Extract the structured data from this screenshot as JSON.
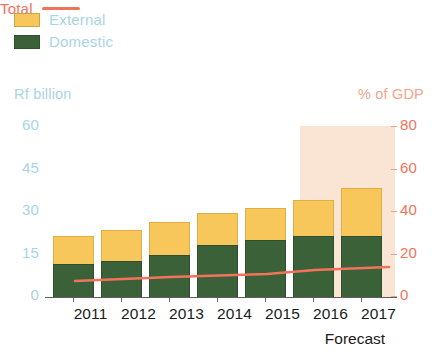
{
  "legend": {
    "external_label": "External",
    "domestic_label": "Domestic",
    "total_label": "Total"
  },
  "axes": {
    "left_title": "Rf billion",
    "right_title": "% of GDP",
    "left_ticks": [
      "0",
      "15",
      "30",
      "45",
      "60"
    ],
    "right_ticks": [
      "0",
      "20",
      "40",
      "60",
      "80"
    ]
  },
  "forecast_caption": "Forecast",
  "colors": {
    "external": "#f7c75c",
    "domestic": "#3b6138",
    "total_line": "#f2725c",
    "forecast_shade": "#f8d9c4",
    "left_axis_text": "#a8d4e8",
    "right_axis_text": "#f2725c",
    "x_axis_text": "#1b1b1b"
  },
  "chart_data": {
    "type": "bar",
    "title": "",
    "subtitle": "",
    "xlabel": "",
    "ylabel": "Rf billion",
    "y2label": "% of GDP",
    "ylim": [
      0,
      60
    ],
    "y2lim": [
      0,
      80
    ],
    "grid": false,
    "legend_position": "top",
    "categories": [
      "2011",
      "2012",
      "2013",
      "2014",
      "2015",
      "2016",
      "2017"
    ],
    "series": [
      {
        "name": "Domestic",
        "stack": "total",
        "color": "#3b6138",
        "values": [
          12.0,
          13.2,
          15.0,
          18.8,
          20.5,
          21.8,
          21.8
        ]
      },
      {
        "name": "External",
        "stack": "total",
        "color": "#f7c75c",
        "values": [
          9.5,
          10.2,
          10.0,
          10.2,
          10.5,
          12.4,
          16.4
        ]
      }
    ],
    "totals": [
      21.5,
      23.4,
      25.0,
      29.0,
      31.0,
      34.2,
      38.2
    ],
    "line_series": {
      "name": "Total",
      "axis": "right",
      "color": "#f2725c",
      "unit": "% of GDP",
      "x": [
        "2011",
        "2012",
        "2013",
        "2014",
        "2015",
        "2016",
        "2017"
      ],
      "values": [
        63.5,
        64.3,
        65.0,
        65.6,
        66.3,
        68.0,
        70.0
      ]
    },
    "annotations": [
      {
        "type": "shaded_region",
        "label": "Forecast",
        "from": "2016",
        "to": "2017"
      }
    ]
  },
  "geometry": {
    "bars": [
      {
        "year": "2011",
        "x": 8,
        "total_h": 62,
        "domestic_h": 34
      },
      {
        "year": "2012",
        "x": 56,
        "total_h": 68,
        "domestic_h": 37
      },
      {
        "year": "2013",
        "x": 104,
        "total_h": 76,
        "domestic_h": 43
      },
      {
        "year": "2014",
        "x": 152,
        "total_h": 85,
        "domestic_h": 53
      },
      {
        "year": "2015",
        "x": 200,
        "total_h": 90,
        "domestic_h": 58
      },
      {
        "year": "2016",
        "x": 248,
        "total_h": 98,
        "domestic_h": 62
      },
      {
        "year": "2017",
        "x": 296,
        "total_h": 110,
        "domestic_h": 62
      }
    ],
    "left_tick_y": [
      296,
      253.5,
      211,
      168.5,
      126
    ],
    "right_tick_y": [
      296,
      253.5,
      211,
      168.5,
      126
    ],
    "xlabel_x": [
      25,
      73,
      121,
      169,
      217,
      265,
      313
    ],
    "forecast_shade": {
      "x": 255,
      "y": 6,
      "w": 95,
      "h": 172
    },
    "line_points": "30,161 78,159 126,157 174,155.5 222,154 270,150 344,147"
  }
}
